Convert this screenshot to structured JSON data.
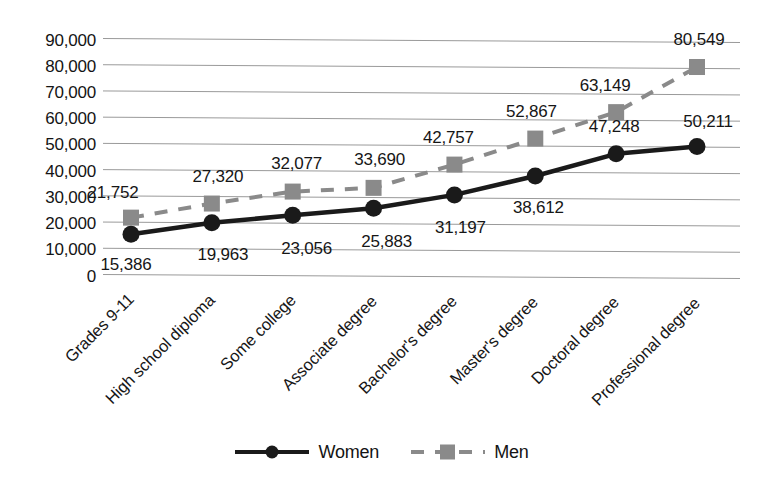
{
  "chart_data": {
    "type": "line",
    "title": "",
    "xlabel": "",
    "ylabel": "",
    "ylim": [
      0,
      90000
    ],
    "ytick_step": 10000,
    "grid": true,
    "legend_position": "bottom",
    "categories": [
      "Grades 9-11",
      "High school diploma",
      "Some college",
      "Associate degree",
      "Bachelor's degree",
      "Master's degree",
      "Doctoral degree",
      "Professional degree"
    ],
    "ytick_labels": [
      "90,000",
      "80,000",
      "70,000",
      "60,000",
      "50,000",
      "40,000",
      "30,000",
      "20,000",
      "10,000",
      "0"
    ],
    "ytick_values": [
      90000,
      80000,
      70000,
      60000,
      50000,
      40000,
      30000,
      20000,
      10000,
      0
    ],
    "series": [
      {
        "name": "Women",
        "color": "#1a1a1a",
        "marker": "circle",
        "line_style": "solid",
        "values": [
          15386,
          19963,
          23056,
          25883,
          31197,
          38612,
          47248,
          50211
        ],
        "value_labels": [
          "15,386",
          "19,963",
          "23,056",
          "25,883",
          "31,197",
          "38,612",
          "47,248",
          "50,211"
        ]
      },
      {
        "name": "Men",
        "color": "#8a8a8a",
        "marker": "square",
        "line_style": "dashed",
        "values": [
          21752,
          27320,
          32077,
          33690,
          42757,
          52867,
          63149,
          80549
        ],
        "value_labels": [
          "21,752",
          "27,320",
          "32,077",
          "33,690",
          "42,757",
          "52,867",
          "63,149",
          "80,549"
        ]
      }
    ]
  },
  "legend": {
    "items": [
      {
        "label": "Women",
        "symbol": "solid-line-circle-marker"
      },
      {
        "label": "Men",
        "symbol": "dashed-line-square-marker"
      }
    ]
  }
}
